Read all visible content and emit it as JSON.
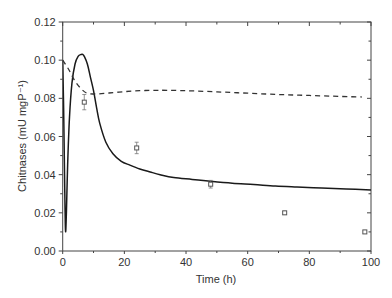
{
  "chart_data": {
    "type": "line",
    "title": "",
    "xlabel": "Time (h)",
    "ylabel": "Chitnases (mU mgP⁻¹)",
    "xlim": [
      0,
      100
    ],
    "ylim": [
      0,
      0.12
    ],
    "x_ticks": [
      0,
      20,
      40,
      60,
      80,
      100
    ],
    "x_tick_labels": [
      "0",
      "20",
      "40",
      "60",
      "80",
      "100"
    ],
    "y_ticks": [
      0.0,
      0.02,
      0.04,
      0.06,
      0.08,
      0.1,
      0.12
    ],
    "y_tick_labels": [
      "0.00",
      "0.02",
      "0.04",
      "0.06",
      "0.08",
      "0.10",
      "0.12"
    ],
    "grid": false,
    "legend": null,
    "series": [
      {
        "name": "model (solid)",
        "style": "solid",
        "color": "#1a1a1a",
        "x": [
          0,
          0.3,
          0.6,
          0.9,
          1.2,
          1.6,
          2.2,
          3,
          4,
          5,
          6,
          6.5,
          7,
          8,
          9,
          10,
          11,
          12,
          14,
          16.3,
          19,
          21.8,
          25,
          28.4,
          31.6,
          36,
          42,
          48,
          55,
          62,
          69,
          76,
          84,
          92,
          100
        ],
        "y": [
          0.1,
          0.075,
          0.04,
          0.011,
          0.02,
          0.045,
          0.07,
          0.088,
          0.098,
          0.102,
          0.103,
          0.103,
          0.102,
          0.098,
          0.091,
          0.084,
          0.075,
          0.067,
          0.057,
          0.051,
          0.047,
          0.045,
          0.043,
          0.0414,
          0.04,
          0.0385,
          0.0375,
          0.0365,
          0.0355,
          0.0348,
          0.034,
          0.0335,
          0.033,
          0.0325,
          0.032
        ]
      },
      {
        "name": "model (dashed)",
        "style": "dashed",
        "color": "#333333",
        "x": [
          0,
          2,
          4,
          6,
          8,
          11,
          15,
          20,
          25,
          30,
          34,
          40,
          50,
          60,
          70,
          80,
          90,
          97
        ],
        "y": [
          0.1,
          0.095,
          0.089,
          0.085,
          0.0826,
          0.0823,
          0.0828,
          0.0835,
          0.084,
          0.0842,
          0.0842,
          0.084,
          0.0834,
          0.0827,
          0.082,
          0.0815,
          0.081,
          0.0807
        ]
      },
      {
        "name": "experimental",
        "style": "markers",
        "marker": "open-square",
        "color": "#555555",
        "x": [
          7,
          24,
          48,
          72,
          98
        ],
        "y": [
          0.078,
          0.054,
          0.035,
          0.02,
          0.01
        ],
        "error": [
          0.004,
          0.003,
          0.002,
          0.0008,
          0.0008
        ]
      }
    ]
  }
}
